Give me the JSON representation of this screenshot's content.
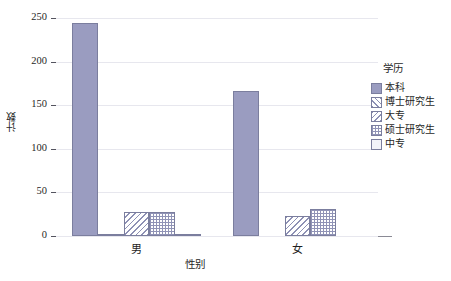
{
  "chart_data": {
    "type": "bar",
    "title": "",
    "subtitle": "",
    "xlabel": "性别",
    "ylabel": "计数",
    "categories": [
      "男",
      "女"
    ],
    "ylim": [
      0,
      250
    ],
    "yticks": [
      0,
      50,
      100,
      150,
      200,
      250
    ],
    "ytick_labels": [
      "0",
      "50",
      "100",
      "150",
      "200",
      "250"
    ],
    "grid": true,
    "grid_axis": "y",
    "legend_position": "right",
    "legend_title": "学历",
    "series": [
      {
        "name": "本科",
        "pattern": "solid",
        "values": [
          244,
          166
        ]
      },
      {
        "name": "博士研究生",
        "pattern": "diag-f",
        "values": [
          1,
          0
        ]
      },
      {
        "name": "大专",
        "pattern": "diag-b",
        "values": [
          28,
          23
        ]
      },
      {
        "name": "硕士研究生",
        "pattern": "grid",
        "values": [
          28,
          31
        ]
      },
      {
        "name": "中专",
        "pattern": "blank",
        "values": [
          2,
          0
        ]
      }
    ],
    "colors": {
      "bar_fill": "#9a9cc0",
      "bar_edge": "#7b7e9e",
      "gridline": "#e7e7ee",
      "axis": "#54545e",
      "background": "#ffffff",
      "text": "#1f1f1f"
    }
  }
}
